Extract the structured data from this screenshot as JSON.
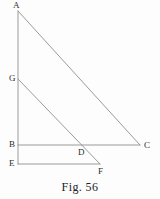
{
  "figure": {
    "caption": "Fig. 56",
    "stroke_color": "#8e8e8e",
    "label_color": "#2e2e2e",
    "background_color": "#fdfdfd",
    "canvas": {
      "width": 160,
      "height": 199
    },
    "points": [
      {
        "id": "A",
        "label": "A",
        "x": 18,
        "y": 11,
        "label_x": 13,
        "label_y": 1
      },
      {
        "id": "G",
        "label": "G",
        "x": 18,
        "y": 79,
        "label_x": 9,
        "label_y": 74
      },
      {
        "id": "B",
        "label": "B",
        "x": 18,
        "y": 145,
        "label_x": 9,
        "label_y": 140
      },
      {
        "id": "E",
        "label": "E",
        "x": 18,
        "y": 164,
        "label_x": 9,
        "label_y": 159
      },
      {
        "id": "D",
        "label": "D",
        "x": 82,
        "y": 145,
        "label_x": 78,
        "label_y": 148
      },
      {
        "id": "F",
        "label": "F",
        "x": 100,
        "y": 164,
        "label_x": 98,
        "label_y": 167
      },
      {
        "id": "C",
        "label": "C",
        "x": 140,
        "y": 145,
        "label_x": 144,
        "label_y": 141
      }
    ],
    "segments": [
      {
        "id": "AE",
        "from": "A",
        "to": "E",
        "x1": 18,
        "y1": 11,
        "x2": 18,
        "y2": 164
      },
      {
        "id": "AC",
        "from": "A",
        "to": "C",
        "x1": 18,
        "y1": 11,
        "x2": 140,
        "y2": 145
      },
      {
        "id": "GF",
        "from": "G",
        "to": "F",
        "x1": 18,
        "y1": 79,
        "x2": 100,
        "y2": 164
      },
      {
        "id": "BC",
        "from": "B",
        "to": "C",
        "x1": 18,
        "y1": 145,
        "x2": 140,
        "y2": 145
      },
      {
        "id": "EF",
        "from": "E",
        "to": "F",
        "x1": 18,
        "y1": 164,
        "x2": 100,
        "y2": 164
      }
    ]
  },
  "chart_data": {
    "type": "diagram",
    "title": "Fig. 56",
    "vertices": [
      "A",
      "G",
      "B",
      "E",
      "D",
      "F",
      "C"
    ],
    "edges": [
      "AE",
      "AC",
      "GF",
      "BC",
      "EF"
    ]
  }
}
